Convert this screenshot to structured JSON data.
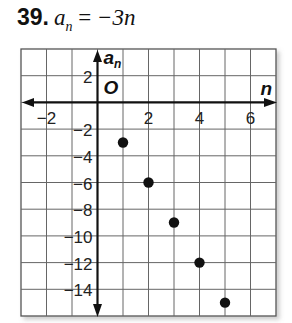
{
  "problem": {
    "number": "39.",
    "lhs_var": "a",
    "lhs_sub": "n",
    "equals": "=",
    "rhs": "−3n"
  },
  "chart_data": {
    "type": "scatter",
    "xlabel": "n",
    "ylabel": "a_n",
    "origin_label": "O",
    "xlim": [
      -3,
      7
    ],
    "ylim": [
      -16,
      4
    ],
    "grid": true,
    "x_tick_labels": [
      "−2",
      "2",
      "4",
      "6"
    ],
    "y_tick_labels": [
      "2",
      "−2",
      "−4",
      "−6",
      "−8",
      "−10",
      "−12",
      "−14"
    ],
    "x": [
      1,
      2,
      3,
      4,
      5
    ],
    "y": [
      -3,
      -6,
      -9,
      -12,
      -15
    ],
    "point_color": "#111111"
  }
}
